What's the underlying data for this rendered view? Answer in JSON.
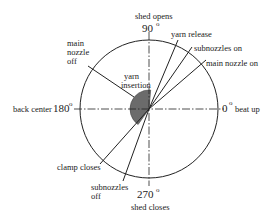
{
  "diagram": {
    "type": "timing-circle",
    "center": {
      "x": 149,
      "y": 109
    },
    "radius": 69,
    "colors": {
      "line": "#222222",
      "sector": "#6b6b6b",
      "background": "#ffffff"
    },
    "axes": {
      "top": {
        "angle": "90",
        "label": "shed opens"
      },
      "right": {
        "angle": "0",
        "label": "beat up"
      },
      "bottom": {
        "angle": "270",
        "label": "shed closes"
      },
      "left": {
        "angle": "180",
        "label": "back center"
      },
      "degree_symbol": "o"
    },
    "sector": {
      "label_line1": "yarn",
      "label_line2": "insertion",
      "start_angle": 85,
      "end_angle": 235,
      "radius": 19
    },
    "events": [
      {
        "label": "yarn release",
        "angle": 68
      },
      {
        "label": "subnozzles on",
        "angle": 56
      },
      {
        "label": "main nozzle on",
        "angle": 42
      },
      {
        "label_lines": [
          "main",
          "nozzle",
          "off"
        ],
        "angle": 145
      },
      {
        "label": "clamp closes",
        "angle": 228
      },
      {
        "label_lines": [
          "subnozzles",
          "off"
        ],
        "angle": 250
      }
    ]
  }
}
